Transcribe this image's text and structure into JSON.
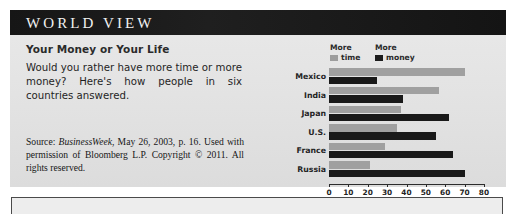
{
  "panel": {
    "title": "WORLD VIEW",
    "subhead": "Your Money or Your Life",
    "deck": "Would you rather have more time or more money? Here's how people in six countries answered.",
    "source_prefix": "Source: ",
    "source_italic": "BusinessWeek",
    "source_rest": ", May 26, 2003, p. 16. Used with permission of Bloomberg L.P. Copyright © 2011. All rights reserved."
  },
  "legend": {
    "time_line1": "More",
    "time_line2": "time",
    "money_line1": "More",
    "money_line2": "money",
    "time_color": "#9d9d9d",
    "money_color": "#1c1c1c"
  },
  "chart_data": {
    "type": "bar",
    "title": "Your Money or Your Life",
    "orientation": "horizontal",
    "grouped": true,
    "categories": [
      "Mexico",
      "India",
      "Japan",
      "U.S.",
      "France",
      "Russia"
    ],
    "series": [
      {
        "name": "More time",
        "color": "#a0a0a0",
        "values": [
          70,
          57,
          37,
          35,
          29,
          21
        ]
      },
      {
        "name": "More money",
        "color": "#191919",
        "values": [
          25,
          38,
          62,
          55,
          64,
          70
        ]
      }
    ],
    "xlabel": "",
    "ylabel": "",
    "xlim": [
      0,
      80
    ],
    "xticks": [
      0,
      10,
      20,
      30,
      40,
      50,
      60,
      70,
      80
    ],
    "xtick_labels": [
      "0",
      "10",
      "20",
      "30",
      "40",
      "50",
      "60",
      "70",
      "80"
    ],
    "grid": false,
    "legend_position": "top"
  }
}
